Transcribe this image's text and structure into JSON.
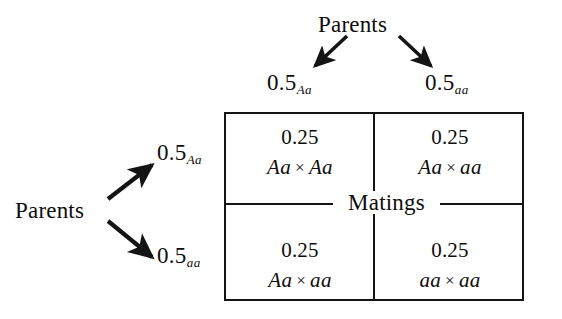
{
  "figure": {
    "type": "mating-frequency-diagram",
    "background_color": "#ffffff",
    "ink_color": "#141414"
  },
  "top_branch": {
    "source_label": "Parents",
    "branches": [
      {
        "value": "0.5",
        "genotype": "Aa",
        "direction": "down-left"
      },
      {
        "value": "0.5",
        "genotype": "aa",
        "direction": "down-right"
      }
    ]
  },
  "left_branch": {
    "source_label": "Parents",
    "branches": [
      {
        "value": "0.5",
        "genotype": "Aa",
        "direction": "up-right"
      },
      {
        "value": "0.5",
        "genotype": "aa",
        "direction": "down-right"
      }
    ]
  },
  "matrix": {
    "caption": "Matings",
    "cross_symbol": "×",
    "cells": [
      {
        "position": "top-left",
        "probability": "0.25",
        "left_genotype": "Aa",
        "right_genotype": "Aa"
      },
      {
        "position": "top-right",
        "probability": "0.25",
        "left_genotype": "Aa",
        "right_genotype": "aa"
      },
      {
        "position": "bottom-left",
        "probability": "0.25",
        "left_genotype": "Aa",
        "right_genotype": "aa"
      },
      {
        "position": "bottom-right",
        "probability": "0.25",
        "left_genotype": "aa",
        "right_genotype": "aa"
      }
    ]
  }
}
